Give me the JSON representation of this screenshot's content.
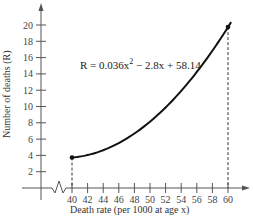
{
  "chart_data": {
    "type": "line",
    "title": "",
    "xlabel": "Death rate (per 1000 at age x)",
    "ylabel": "Number of deaths (R)",
    "equation": {
      "prefix": "R = 0.036x",
      "exponent": "2",
      "suffix": " − 2.8x + 58.14"
    },
    "function": {
      "a": 0.036,
      "b": -2.8,
      "c": 58.14
    },
    "domain": [
      40,
      60
    ],
    "x_ticks": [
      40,
      42,
      44,
      46,
      48,
      50,
      52,
      54,
      56,
      58,
      60
    ],
    "y_ticks": [
      2,
      4,
      6,
      8,
      10,
      12,
      14,
      16,
      18,
      20
    ],
    "endpoints": [
      {
        "x": 40,
        "y": 3.74
      },
      {
        "x": 60,
        "y": 20.94
      }
    ],
    "x": [
      40,
      42,
      44,
      46,
      48,
      50,
      52,
      54,
      56,
      58,
      60
    ],
    "series": [
      {
        "name": "R",
        "values": [
          3.74,
          3.76,
          4.5,
          5.94,
          8.1,
          10.94,
          14.5,
          18.76,
          23.74,
          29.42,
          20.94
        ]
      }
    ],
    "axis_break": "x-axis zigzag between 0 and 40",
    "ylim": [
      0,
      22
    ],
    "grid": false,
    "legend": "none"
  }
}
